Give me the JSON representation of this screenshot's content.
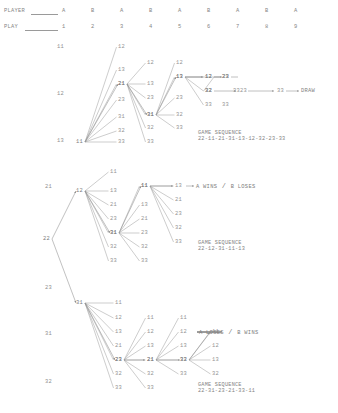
{
  "page": {
    "type": "move-tree",
    "background": "#ffffff",
    "ink": "#8a8a8a"
  },
  "header": {
    "row_labels": [
      {
        "text": "PLAYER",
        "has_leader": true
      },
      {
        "text": "PLAY",
        "has_leader": true
      }
    ],
    "player_row": [
      "A",
      "B",
      "A",
      "B",
      "A",
      "B",
      "A",
      "B",
      "A"
    ],
    "play_row": [
      "1",
      "2",
      "3",
      "4",
      "5",
      "6",
      "7",
      "8",
      "9"
    ],
    "column_x": [
      62,
      91,
      120,
      149,
      178,
      207,
      236,
      265,
      294
    ]
  },
  "left_axis": {
    "labels": [
      {
        "text": "11",
        "x": 57,
        "y": 44
      },
      {
        "text": "12",
        "x": 57,
        "y": 91
      },
      {
        "text": "13",
        "x": 57,
        "y": 138
      },
      {
        "text": "21",
        "x": 45,
        "y": 184
      },
      {
        "text": "23",
        "x": 45,
        "y": 285
      },
      {
        "text": "31",
        "x": 45,
        "y": 331
      },
      {
        "text": "32",
        "x": 45,
        "y": 379
      }
    ]
  },
  "root": {
    "label": "22",
    "x": 43,
    "y": 236
  },
  "fans": [
    {
      "id": "fan-11",
      "node": {
        "label": "11",
        "x": 76,
        "y": 139
      },
      "children": [
        "12",
        "13",
        "21",
        "23",
        "31",
        "32",
        "33"
      ],
      "child_positions": [
        {
          "label": "12",
          "x": 118,
          "y": 44
        },
        {
          "label": "13",
          "x": 118,
          "y": 67
        },
        {
          "label": "21",
          "x": 118,
          "y": 81
        },
        {
          "label": "23",
          "x": 118,
          "y": 97
        },
        {
          "label": "31",
          "x": 118,
          "y": 114
        },
        {
          "label": "32",
          "x": 118,
          "y": 128
        },
        {
          "label": "33",
          "x": 118,
          "y": 139
        }
      ]
    },
    {
      "id": "fan-21",
      "node": {
        "label": "21",
        "x": 118,
        "y": 81
      },
      "children": [
        "12",
        "13",
        "23",
        "31",
        "32",
        "33"
      ],
      "child_positions": [
        {
          "label": "12",
          "x": 147,
          "y": 60
        },
        {
          "label": "13",
          "x": 147,
          "y": 81
        },
        {
          "label": "23",
          "x": 147,
          "y": 95
        },
        {
          "label": "31",
          "x": 147,
          "y": 112
        },
        {
          "label": "32",
          "x": 147,
          "y": 125
        },
        {
          "label": "33",
          "x": 147,
          "y": 139
        }
      ]
    },
    {
      "id": "fan-31",
      "node": {
        "label": "31",
        "x": 147,
        "y": 112
      },
      "children": [
        "12",
        "13",
        "23",
        "32",
        "33"
      ],
      "child_positions": [
        {
          "label": "12",
          "x": 176,
          "y": 60
        },
        {
          "label": "13",
          "x": 176,
          "y": 74
        },
        {
          "label": "23",
          "x": 176,
          "y": 95
        },
        {
          "label": "32",
          "x": 176,
          "y": 112
        },
        {
          "label": "33",
          "x": 176,
          "y": 125
        }
      ]
    },
    {
      "id": "fan-13a",
      "node": {
        "label": "13",
        "x": 176,
        "y": 74
      },
      "children": [
        "12",
        "23",
        "32",
        "33"
      ],
      "child_positions": [
        {
          "label": "12",
          "x": 205,
          "y": 74
        },
        {
          "label": "23",
          "x": 222,
          "y": 74
        },
        {
          "label": "32",
          "x": 205,
          "y": 88
        },
        {
          "label": "33",
          "x": 205,
          "y": 102
        }
      ]
    },
    {
      "id": "fan-12-mid",
      "node": {
        "label": "12",
        "x": 205,
        "y": 74
      },
      "children": [
        "23",
        "32"
      ],
      "child_positions": [
        {
          "label": "23",
          "x": 222,
          "y": 74
        },
        {
          "label": "32",
          "x": 205,
          "y": 88
        }
      ]
    },
    {
      "id": "fan-12b",
      "node": {
        "label": "12",
        "x": 76,
        "y": 188
      },
      "children": [
        "11",
        "13",
        "21",
        "23",
        "31",
        "32",
        "33"
      ],
      "child_positions": [
        {
          "label": "11",
          "x": 110,
          "y": 169
        },
        {
          "label": "13",
          "x": 110,
          "y": 188
        },
        {
          "label": "21",
          "x": 110,
          "y": 202
        },
        {
          "label": "23",
          "x": 110,
          "y": 216
        },
        {
          "label": "31",
          "x": 110,
          "y": 230
        },
        {
          "label": "32",
          "x": 110,
          "y": 244
        },
        {
          "label": "33",
          "x": 110,
          "y": 258
        }
      ]
    },
    {
      "id": "fan-31b",
      "node": {
        "label": "31",
        "x": 110,
        "y": 230
      },
      "children": [
        "11",
        "13",
        "21",
        "23",
        "32",
        "33"
      ],
      "child_positions": [
        {
          "label": "11",
          "x": 141,
          "y": 183
        },
        {
          "label": "13",
          "x": 141,
          "y": 202
        },
        {
          "label": "21",
          "x": 141,
          "y": 216
        },
        {
          "label": "23",
          "x": 141,
          "y": 230
        },
        {
          "label": "32",
          "x": 141,
          "y": 244
        },
        {
          "label": "33",
          "x": 141,
          "y": 258
        }
      ]
    },
    {
      "id": "fan-11b",
      "node": {
        "label": "11",
        "x": 141,
        "y": 183
      },
      "children": [
        "13",
        "21",
        "23",
        "32",
        "33"
      ],
      "child_positions": [
        {
          "label": "13",
          "x": 175,
          "y": 183
        },
        {
          "label": "21",
          "x": 175,
          "y": 197
        },
        {
          "label": "23",
          "x": 175,
          "y": 211
        },
        {
          "label": "32",
          "x": 175,
          "y": 225
        },
        {
          "label": "33",
          "x": 175,
          "y": 239
        }
      ]
    },
    {
      "id": "fan-31c",
      "node": {
        "label": "31",
        "x": 76,
        "y": 300
      },
      "children": [
        "11",
        "12",
        "13",
        "21",
        "23",
        "32",
        "33"
      ],
      "child_positions": [
        {
          "label": "11",
          "x": 115,
          "y": 300
        },
        {
          "label": "12",
          "x": 115,
          "y": 315
        },
        {
          "label": "13",
          "x": 115,
          "y": 329
        },
        {
          "label": "21",
          "x": 115,
          "y": 343
        },
        {
          "label": "23",
          "x": 115,
          "y": 357
        },
        {
          "label": "32",
          "x": 115,
          "y": 371
        },
        {
          "label": "33",
          "x": 115,
          "y": 385
        }
      ]
    },
    {
      "id": "fan-23c",
      "node": {
        "label": "23",
        "x": 115,
        "y": 357
      },
      "children": [
        "11",
        "12",
        "13",
        "21",
        "32",
        "33"
      ],
      "child_positions": [
        {
          "label": "11",
          "x": 147,
          "y": 315
        },
        {
          "label": "12",
          "x": 147,
          "y": 329
        },
        {
          "label": "13",
          "x": 147,
          "y": 343
        },
        {
          "label": "21",
          "x": 147,
          "y": 357
        },
        {
          "label": "32",
          "x": 147,
          "y": 371
        },
        {
          "label": "33",
          "x": 147,
          "y": 385
        }
      ]
    },
    {
      "id": "fan-21c",
      "node": {
        "label": "21",
        "x": 147,
        "y": 357
      },
      "children": [
        "11",
        "12",
        "13",
        "32",
        "33"
      ],
      "child_positions": [
        {
          "label": "11",
          "x": 180,
          "y": 315
        },
        {
          "label": "12",
          "x": 180,
          "y": 329
        },
        {
          "label": "13",
          "x": 180,
          "y": 343
        },
        {
          "label": "32",
          "x": 180,
          "y": 357
        },
        {
          "label": "33",
          "x": 180,
          "y": 371
        }
      ]
    },
    {
      "id": "fan-33c",
      "node": {
        "label": "33",
        "x": 180,
        "y": 357
      },
      "children": [
        "11",
        "12",
        "13",
        "32"
      ],
      "child_positions": [
        {
          "label": "11",
          "x": 212,
          "y": 329
        },
        {
          "label": "12",
          "x": 212,
          "y": 343
        },
        {
          "label": "13",
          "x": 212,
          "y": 357
        },
        {
          "label": "32",
          "x": 212,
          "y": 371
        }
      ]
    }
  ],
  "chain_top": [
    {
      "label": "23",
      "x": 222,
      "y": 74
    },
    {
      "label": "32",
      "x": 205,
      "y": 88
    },
    {
      "label": "23",
      "x": 240,
      "y": 88
    },
    {
      "label": "33",
      "x": 233,
      "y": 88
    },
    {
      "label": "33",
      "x": 277,
      "y": 88
    },
    {
      "label": "33",
      "x": 222,
      "y": 102
    }
  ],
  "outcomes": [
    {
      "id": "outcome-draw",
      "text": "DRAW",
      "x": 301,
      "y": 88
    },
    {
      "id": "outcome-a-wins",
      "text": "A WINS",
      "sep": "/",
      "text2": "B LOSES",
      "x": 196,
      "y": 183
    },
    {
      "id": "outcome-a-loses",
      "text": "A LOSES",
      "sep": "/",
      "text2": "B WINS",
      "x": 199,
      "y": 329
    }
  ],
  "sequences": [
    {
      "id": "game-sequence-draw",
      "title": "GAME SEQUENCE",
      "moves": "22-11-21-31-13-12-32-23-33",
      "x": 198,
      "y": 130
    },
    {
      "id": "game-sequence-a-wins",
      "title": "GAME SEQUENCE",
      "moves": "22-12-31-11-13",
      "x": 198,
      "y": 240
    },
    {
      "id": "game-sequence-a-loses",
      "title": "GAME SEQUENCE",
      "moves": "22-31-23-21-33-11",
      "x": 198,
      "y": 382
    }
  ]
}
